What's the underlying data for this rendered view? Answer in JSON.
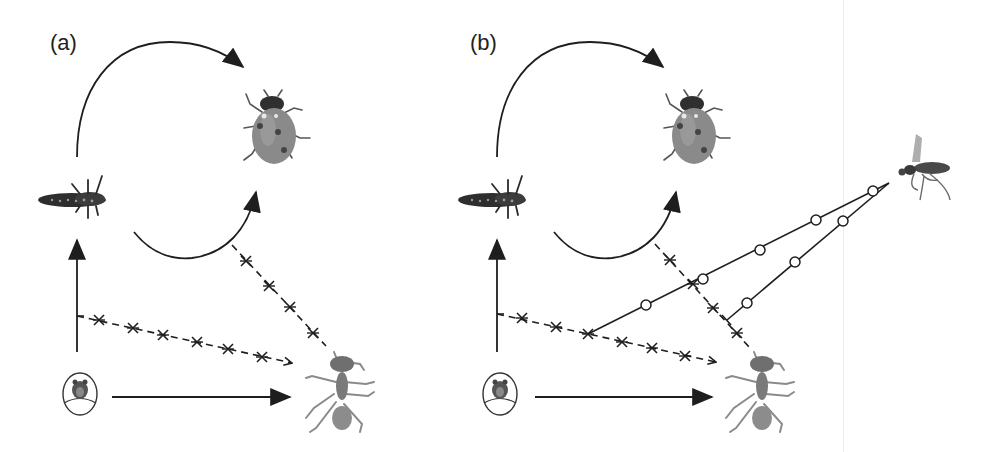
{
  "figure": {
    "panels": [
      {
        "id": "a",
        "label": "(a)",
        "nodes": [
          "larva",
          "adult-ladybird",
          "egg",
          "ant"
        ],
        "edges": [
          {
            "from": "larva",
            "to": "adult-ladybird",
            "style": "solid-arc",
            "meaning": "development"
          },
          {
            "from": "egg",
            "to": "larva",
            "style": "solid",
            "meaning": "development"
          },
          {
            "from": "egg",
            "to": "ant",
            "style": "solid",
            "meaning": "interaction"
          },
          {
            "from": "vertical-arrow",
            "to": "ant",
            "style": "dashed-crossed",
            "meaning": "disrupted interaction"
          },
          {
            "from": "lower-arc",
            "to": "ant",
            "style": "dashed-crossed",
            "meaning": "disrupted interaction"
          }
        ]
      },
      {
        "id": "b",
        "label": "(b)",
        "nodes": [
          "larva",
          "adult-ladybird",
          "egg",
          "ant",
          "parasitoid-wasp"
        ],
        "edges": [
          {
            "from": "larva",
            "to": "adult-ladybird",
            "style": "solid-arc"
          },
          {
            "from": "egg",
            "to": "larva",
            "style": "solid"
          },
          {
            "from": "egg",
            "to": "ant",
            "style": "solid"
          },
          {
            "from": "vertical-arrow",
            "to": "ant",
            "style": "dashed-crossed"
          },
          {
            "from": "lower-arc",
            "to": "ant",
            "style": "dashed-crossed"
          },
          {
            "from": "parasitoid-wasp",
            "to": "dashed-line-a",
            "style": "solid-circled"
          },
          {
            "from": "parasitoid-wasp",
            "to": "dashed-line-b",
            "style": "solid-circled"
          }
        ]
      }
    ],
    "colors": {
      "line": "#1e1e1e",
      "insect_dark": "#3a3a3a",
      "insect_mid": "#7a7a7a",
      "insect_light": "#a8a8a8"
    }
  }
}
